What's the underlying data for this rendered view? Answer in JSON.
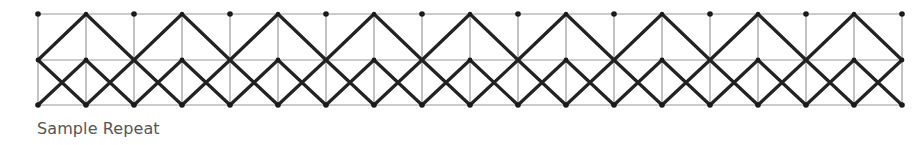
{
  "caption": "Sample Repeat",
  "grid": {
    "x0": 38,
    "spacing": 48,
    "columns": 19,
    "rows_y": [
      14,
      60,
      105
    ]
  },
  "colors": {
    "grid_line": "#9a9a9a",
    "pattern_line": "#222222",
    "dot": "#1a1a1a",
    "caption": "#555555"
  }
}
